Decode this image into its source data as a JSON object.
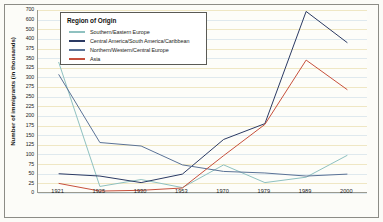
{
  "chart_data": {
    "type": "line",
    "title": "",
    "xlabel": "",
    "ylabel": "Number of immigrants (in thousands)",
    "legend_title": "Region of Origin",
    "legend_position": "top-left-inside",
    "grid": true,
    "categories": [
      "1921",
      "1925",
      "1930",
      "1953",
      "1970",
      "1979",
      "1989",
      "2000"
    ],
    "ytick_labels": [
      "700",
      "600",
      "500",
      "400",
      "375",
      "350",
      "325",
      "300",
      "275",
      "250",
      "225",
      "200",
      "175",
      "150",
      "125",
      "100",
      "75",
      "50",
      "25",
      "0"
    ],
    "ylim": [
      0,
      700
    ],
    "series": [
      {
        "name": "Southern/Eastern Europe",
        "color": "#8fc1c0",
        "values": [
          340,
          17,
          35,
          14,
          73,
          27,
          41,
          98
        ]
      },
      {
        "name": "Central America/South America/Caribbean",
        "color": "#2b3a63",
        "values": [
          50,
          44,
          27,
          49,
          139,
          180,
          685,
          390
        ]
      },
      {
        "name": "Northern/Western/Central Europe",
        "color": "#5a7296",
        "values": [
          308,
          131,
          122,
          73,
          56,
          52,
          44,
          49
        ]
      },
      {
        "name": "Asia",
        "color": "#c7503c",
        "values": [
          25,
          5,
          7,
          13,
          97,
          178,
          345,
          268
        ]
      }
    ]
  },
  "axis": {
    "y_title": "Number of immigrants (in thousands)"
  }
}
